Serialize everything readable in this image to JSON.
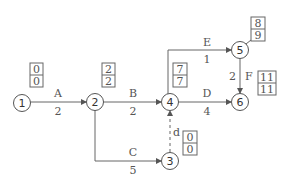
{
  "diagram": {
    "type": "activity-network",
    "nodes": [
      {
        "id": "1",
        "label": "1",
        "earliest": "0",
        "latest": "0"
      },
      {
        "id": "2",
        "label": "2",
        "earliest": "2",
        "latest": "2"
      },
      {
        "id": "3",
        "label": "3",
        "earliest": "0",
        "latest": "0"
      },
      {
        "id": "4",
        "label": "4",
        "earliest": "7",
        "latest": "7"
      },
      {
        "id": "5",
        "label": "5",
        "earliest": "8",
        "latest": "9"
      },
      {
        "id": "6",
        "label": "6",
        "earliest": "11",
        "latest": "11"
      }
    ],
    "activities": [
      {
        "name": "A",
        "duration": "2",
        "from": "1",
        "to": "2",
        "style": "solid"
      },
      {
        "name": "B",
        "duration": "2",
        "from": "2",
        "to": "4",
        "style": "solid"
      },
      {
        "name": "C",
        "duration": "5",
        "from": "2",
        "to": "3",
        "style": "solid"
      },
      {
        "name": "d",
        "duration": "",
        "from": "3",
        "to": "4",
        "style": "dashed"
      },
      {
        "name": "D",
        "duration": "4",
        "from": "4",
        "to": "6",
        "style": "solid"
      },
      {
        "name": "E",
        "duration": "1",
        "from": "4",
        "to": "5",
        "style": "solid"
      },
      {
        "name": "F",
        "duration": "2",
        "from": "5",
        "to": "6",
        "style": "solid"
      }
    ]
  }
}
